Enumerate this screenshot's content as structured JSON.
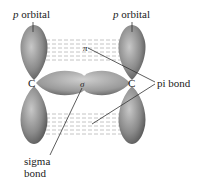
{
  "labels": {
    "p_orbital_left": {
      "italic": "p",
      "text": " orbital"
    },
    "p_orbital_right": {
      "italic": "p",
      "text": " orbital"
    },
    "carbon_left": "C",
    "carbon_right": "C",
    "pi_bond": "pi bond",
    "sigma_bond_line1": "sigma",
    "sigma_bond_line2": "bond",
    "pi_symbol": "π",
    "sigma_symbol": "σ"
  },
  "colors": {
    "lobe_dark": "#5a5a5a",
    "lobe_light": "#bdbdbd",
    "dash": "#b0b0b0",
    "leader": "#333333"
  }
}
